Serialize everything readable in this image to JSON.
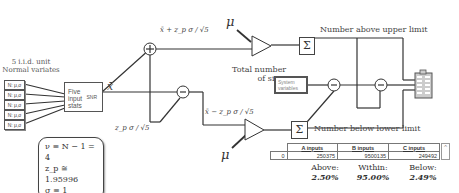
{
  "inputs": {
    "title_line1": "5 i.i.d. unit",
    "title_line2": "Normal variates",
    "variates": [
      "N: μ,σ",
      "N: μ,σ",
      "N: μ,σ",
      "N: μ,σ",
      "N: μ,σ"
    ]
  },
  "stats_block": {
    "label_line1": "Five",
    "label_line2": "input",
    "label_line3": "stats",
    "port_label": "SNR"
  },
  "signals": {
    "xbar": "x̄",
    "upper_formula": "x̄ + z_p σ / √5",
    "lower_formula": "x̄ − z_p σ / √5",
    "offset": "z_p σ / √5",
    "mu_upper": "μ",
    "mu_lower": "μ"
  },
  "summers": {
    "upper_label": "Number above upper limit",
    "lower_label": "Number below lower limit",
    "sigma_glyph": "Σ"
  },
  "total_sims": {
    "label_line1": "Total number",
    "label_line2": "of sims",
    "system_variables_line1": "System",
    "system_variables_line2": "variables"
  },
  "parameters": {
    "line1": "ν ≡ N − 1 = 4",
    "line2": "z_p ≅ 1.95996",
    "line3": "σ ≡ 1"
  },
  "results_table": {
    "headers": [
      "",
      "A inputs",
      "B inputs",
      "C inputs"
    ],
    "rows": [
      [
        "0",
        "250375",
        "9500135",
        "249492"
      ]
    ]
  },
  "percentages": [
    {
      "label": "Above:",
      "value": "2.50%"
    },
    {
      "label": "Within:",
      "value": "95.00%"
    },
    {
      "label": "Below:",
      "value": "2.49%"
    }
  ]
}
